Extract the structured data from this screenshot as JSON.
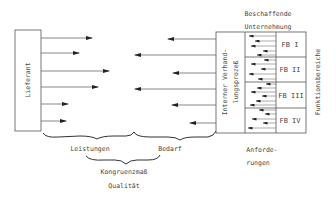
{
  "diagram": {
    "supplier_label": "Lieferant",
    "company_title_line1": "Beschaffende",
    "company_title_line2": "Unternehmung",
    "internal_process_line1": "Interner Verhand-",
    "internal_process_line2": "lungsprozeß",
    "functional_areas_label": "Funktionsbereiche",
    "functional_areas": [
      "FB I",
      "FB II",
      "FB III",
      "FB IV"
    ],
    "brace_left_label": "Leistungen",
    "brace_right_label": "Bedarf",
    "brace_bottom_label": "Kongruenzmaß",
    "quality_label": "Qualität",
    "requirements_line1": "Anforde-",
    "requirements_line2": "rungen"
  },
  "colors": {
    "stroke": "#555555",
    "text": "#444444",
    "background": "#ffffff"
  }
}
